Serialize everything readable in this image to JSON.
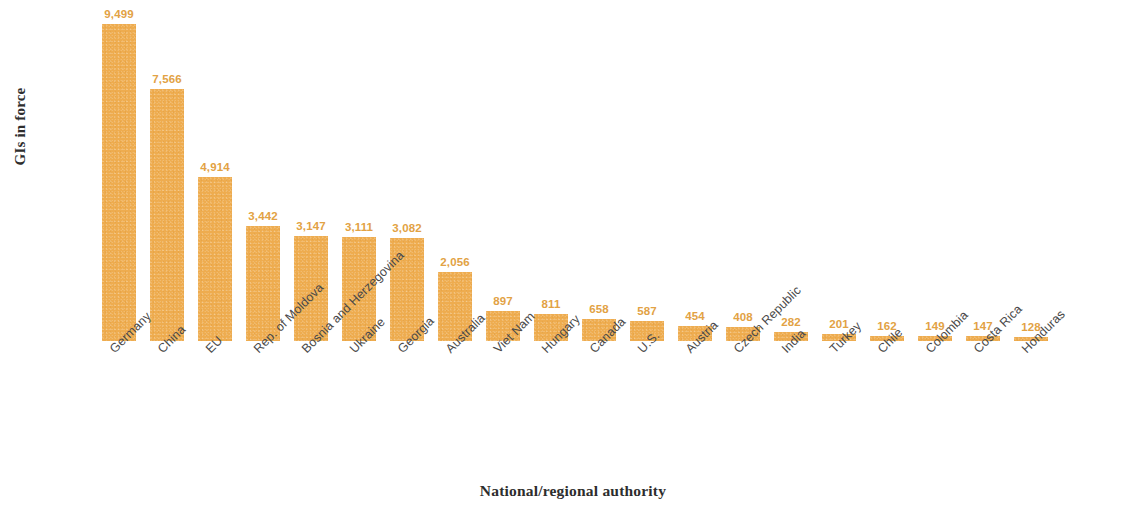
{
  "chart_data": {
    "type": "bar",
    "title": "",
    "subtitle": "",
    "xlabel": "National/regional authority",
    "ylabel": "GIs in force",
    "orientation": "vertical",
    "grid": false,
    "legend": false,
    "legend_position": "none",
    "bar_color": "#EEAC4F",
    "label_color": "#E2A244",
    "axis_text_color": "#4A4A4A",
    "background_color": "#FFFFFF",
    "ylim": [
      0,
      9499
    ],
    "categories": [
      "Germany",
      "China",
      "EU",
      "Rep. of Moldova",
      "Bosnia and Herzegovina",
      "Ukraine",
      "Georgia",
      "Australia",
      "Viet Nam",
      "Hungary",
      "Canada",
      "U.S.",
      "Austria",
      "Czech Republic",
      "India",
      "Turkey",
      "Chile",
      "Colombia",
      "Costa Rica",
      "Honduras"
    ],
    "values": [
      9499,
      7566,
      4914,
      3442,
      3147,
      3111,
      3082,
      2056,
      897,
      811,
      658,
      587,
      454,
      408,
      282,
      201,
      162,
      149,
      147,
      128
    ],
    "value_labels": [
      "9,499",
      "7,566",
      "4,914",
      "3,442",
      "3,147",
      "3,111",
      "3,082",
      "2,056",
      "897",
      "811",
      "658",
      "587",
      "454",
      "408",
      "282",
      "201",
      "162",
      "149",
      "147",
      "128"
    ]
  }
}
